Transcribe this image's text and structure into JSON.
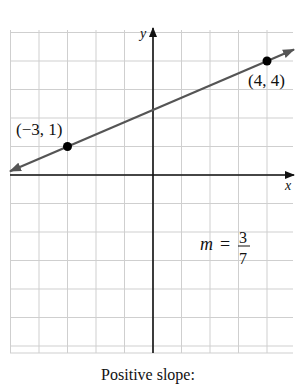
{
  "chart_data": {
    "type": "line",
    "title": "",
    "xlabel": "x",
    "ylabel": "y",
    "xlim": [
      -5,
      5
    ],
    "ylim": [
      -6,
      5
    ],
    "grid": true,
    "series": [
      {
        "name": "line",
        "x": [
          -3,
          4
        ],
        "y": [
          1,
          4
        ],
        "color": "#555555",
        "extends_both_directions": true
      }
    ],
    "points": [
      {
        "x": -3,
        "y": 1,
        "label": "(−3, 1)"
      },
      {
        "x": 4,
        "y": 4,
        "label": "(4, 4)"
      }
    ],
    "annotations": [
      {
        "text": "m = 3/7",
        "numerator": "3",
        "denominator": "7",
        "x": 2.0,
        "y": -3.2
      }
    ]
  },
  "labels": {
    "x_axis": "x",
    "y_axis": "y",
    "point1": "(−3, 1)",
    "point2": "(4, 4)",
    "slope_m": "m",
    "slope_eq": "=",
    "slope_num": "3",
    "slope_den": "7",
    "caption": "Positive slope:"
  }
}
